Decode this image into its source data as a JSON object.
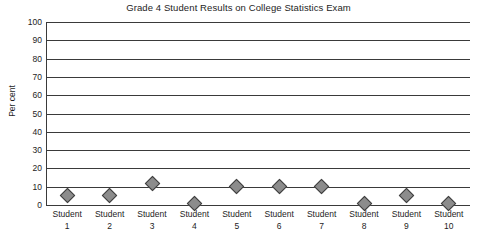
{
  "chart_data": {
    "type": "scatter",
    "title": "Grade 4 Student Results on College Statistics Exam",
    "xlabel": "",
    "ylabel": "Per cent",
    "categories": [
      "Student 1",
      "Student 2",
      "Student 3",
      "Student 4",
      "Student 5",
      "Student 6",
      "Student 7",
      "Student 8",
      "Student 9",
      "Student 10"
    ],
    "category_lines": [
      {
        "name": "Student",
        "num": "1"
      },
      {
        "name": "Student",
        "num": "2"
      },
      {
        "name": "Student",
        "num": "3"
      },
      {
        "name": "Student",
        "num": "4"
      },
      {
        "name": "Student",
        "num": "5"
      },
      {
        "name": "Student",
        "num": "6"
      },
      {
        "name": "Student",
        "num": "7"
      },
      {
        "name": "Student",
        "num": "8"
      },
      {
        "name": "Student",
        "num": "9"
      },
      {
        "name": "Student",
        "num": "10"
      }
    ],
    "values": [
      5,
      5,
      12,
      1,
      10,
      10,
      10,
      1,
      5,
      1
    ],
    "ylim": [
      0,
      100
    ],
    "ytick_values": [
      100,
      90,
      80,
      70,
      60,
      50,
      40,
      30,
      20,
      10,
      0
    ],
    "ytick_labels": [
      "100",
      "90",
      "80",
      "70",
      "60",
      "50",
      "40",
      "30",
      "20",
      "10",
      "0"
    ],
    "grid": "horizontal",
    "legend": "none",
    "marker_shape": "diamond",
    "marker_fill_color": "#8c8c8c",
    "marker_edge_color": "#3d3d3d",
    "gridline_color": "#3a3a3a",
    "background_color": "#ffffff"
  }
}
